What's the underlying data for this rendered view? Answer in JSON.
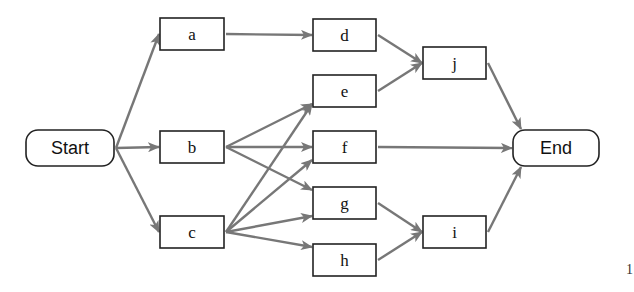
{
  "diagram": {
    "type": "activity-network",
    "nodes": [
      {
        "id": "start",
        "label": "Start",
        "shape": "rounded",
        "x": 26,
        "y": 130,
        "w": 88,
        "h": 36
      },
      {
        "id": "a",
        "label": "a",
        "shape": "rect",
        "x": 160,
        "y": 18,
        "w": 64,
        "h": 32
      },
      {
        "id": "b",
        "label": "b",
        "shape": "rect",
        "x": 160,
        "y": 131,
        "w": 64,
        "h": 32
      },
      {
        "id": "c",
        "label": "c",
        "shape": "rect",
        "x": 160,
        "y": 216,
        "w": 64,
        "h": 32
      },
      {
        "id": "d",
        "label": "d",
        "shape": "rect",
        "x": 313,
        "y": 19,
        "w": 63,
        "h": 32
      },
      {
        "id": "e",
        "label": "e",
        "shape": "rect",
        "x": 313,
        "y": 75,
        "w": 63,
        "h": 32
      },
      {
        "id": "f",
        "label": "f",
        "shape": "rect",
        "x": 313,
        "y": 131,
        "w": 63,
        "h": 32
      },
      {
        "id": "g",
        "label": "g",
        "shape": "rect",
        "x": 313,
        "y": 187,
        "w": 63,
        "h": 32
      },
      {
        "id": "h",
        "label": "h",
        "shape": "rect",
        "x": 313,
        "y": 244,
        "w": 63,
        "h": 32
      },
      {
        "id": "j",
        "label": "j",
        "shape": "rect",
        "x": 423,
        "y": 47,
        "w": 63,
        "h": 32
      },
      {
        "id": "i",
        "label": "i",
        "shape": "rect",
        "x": 423,
        "y": 216,
        "w": 63,
        "h": 32
      },
      {
        "id": "end",
        "label": "End",
        "shape": "rounded",
        "x": 513,
        "y": 130,
        "w": 86,
        "h": 36
      }
    ],
    "edges": [
      {
        "from": "start",
        "to": "a"
      },
      {
        "from": "start",
        "to": "b"
      },
      {
        "from": "start",
        "to": "c"
      },
      {
        "from": "a",
        "to": "d"
      },
      {
        "from": "b",
        "to": "e"
      },
      {
        "from": "b",
        "to": "f"
      },
      {
        "from": "b",
        "to": "g"
      },
      {
        "from": "c",
        "to": "e"
      },
      {
        "from": "c",
        "to": "f"
      },
      {
        "from": "c",
        "to": "g"
      },
      {
        "from": "c",
        "to": "h"
      },
      {
        "from": "d",
        "to": "j"
      },
      {
        "from": "e",
        "to": "j"
      },
      {
        "from": "f",
        "to": "end"
      },
      {
        "from": "g",
        "to": "i"
      },
      {
        "from": "h",
        "to": "i"
      },
      {
        "from": "j",
        "to": "end"
      },
      {
        "from": "i",
        "to": "end"
      }
    ],
    "colors": {
      "edge": "#777777",
      "border": "#222222",
      "text": "#111111"
    }
  },
  "stray_text": "1"
}
